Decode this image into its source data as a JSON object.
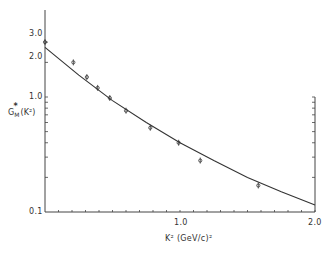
{
  "chart_data": {
    "type": "scatter",
    "title": "",
    "xlabel": "K² (GeV/c)²",
    "ylabel": "G*M (K²)",
    "yscale": "log",
    "xlim": [
      0,
      2.0
    ],
    "ylim": [
      0.1,
      3.0
    ],
    "x_tick_labels": [
      "1.0",
      "2.0"
    ],
    "y_tick_labels": [
      "0.1",
      "1.0",
      "2.0",
      "3.0"
    ],
    "grid": false,
    "legend": null,
    "series": [
      {
        "name": "data",
        "style": "markers-with-error-bars",
        "x": [
          0.0,
          0.21,
          0.31,
          0.39,
          0.48,
          0.6,
          0.78,
          0.99,
          1.15,
          1.58
        ],
        "y": [
          3.0,
          2.0,
          1.49,
          1.2,
          0.98,
          0.76,
          0.54,
          0.4,
          0.28,
          0.17
        ]
      },
      {
        "name": "fit",
        "style": "line",
        "x": [
          0.0,
          0.25,
          0.5,
          0.75,
          1.0,
          1.25,
          1.5,
          1.75,
          2.0
        ],
        "y": [
          2.7,
          1.55,
          0.93,
          0.6,
          0.4,
          0.28,
          0.2,
          0.15,
          0.115
        ]
      }
    ]
  },
  "labels": {
    "y_axis_main": "G",
    "y_axis_sub": "M",
    "y_axis_sup": "*",
    "y_axis_arg": "(K²)",
    "x_axis": "K²  (GeV/c)²",
    "x_tick_1": "1.0",
    "x_tick_2": "2.0",
    "y_tick_01": "0.1",
    "y_tick_1": "1.0",
    "y_tick_2": "2.0",
    "y_tick_3": "3.0"
  }
}
